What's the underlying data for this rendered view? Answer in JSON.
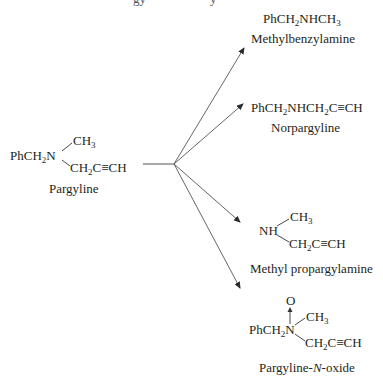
{
  "top_clipped": {
    "fragment_left": "gy",
    "fragment_right": "y"
  },
  "reactant": {
    "name": "Pargyline",
    "left_group": {
      "prefix": "PhCH",
      "sub": "2",
      "suffix": "N"
    },
    "upper_branch": {
      "prefix": "CH",
      "sub": "3"
    },
    "lower_branch": {
      "prefix": "CH",
      "sub": "2",
      "suffix": "C",
      "triple": "≡",
      "end": "CH"
    }
  },
  "products": [
    {
      "id": "methylbenzylamine",
      "name": "Methylbenzylamine",
      "formula": {
        "p1": "PhCH",
        "s1": "2",
        "p2": "NHCH",
        "s2": "3"
      }
    },
    {
      "id": "norpargyline",
      "name": "Norpargyline",
      "formula": {
        "p1": "PhCH",
        "s1": "2",
        "p2": "NHCH",
        "s2": "2",
        "p3": "C",
        "triple": "≡",
        "end": "CH"
      }
    },
    {
      "id": "methyl-propargylamine",
      "name": "Methyl propargylamine",
      "left_group": "NH",
      "upper_branch": {
        "prefix": "CH",
        "sub": "3"
      },
      "lower_branch": {
        "prefix": "CH",
        "sub": "2",
        "suffix": "C",
        "triple": "≡",
        "end": "CH"
      }
    },
    {
      "id": "pargyline-n-oxide",
      "name_parts": {
        "before": "Pargyline-",
        "italic": "N",
        "after": "-oxide"
      },
      "oxygen": "O",
      "left_group": {
        "prefix": "PhCH",
        "sub": "2",
        "suffix": "N"
      },
      "upper_branch": {
        "prefix": "CH",
        "sub": "3"
      },
      "lower_branch": {
        "prefix": "CH",
        "sub": "2",
        "suffix": "C",
        "triple": "≡",
        "end": "CH"
      }
    }
  ],
  "arrows": {
    "origin": [
      174,
      164
    ],
    "stem_start": [
      143,
      164
    ],
    "targets": [
      [
        244,
        48
      ],
      [
        243,
        104
      ],
      [
        240,
        222
      ],
      [
        240,
        288
      ]
    ],
    "color": "#4a4a4a"
  }
}
